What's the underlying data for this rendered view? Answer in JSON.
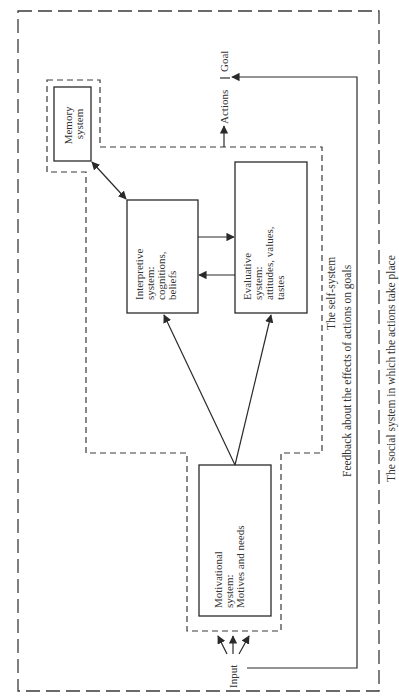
{
  "diagram": {
    "boxes": {
      "memory": {
        "lines": [
          "Memory",
          "system"
        ]
      },
      "interpretive": {
        "lines": [
          "Interpretive",
          "system:",
          "cognitions,",
          "beliefs"
        ]
      },
      "evaluative": {
        "lines": [
          "Evaluative",
          "system:",
          "attitudes, values,",
          "tastes"
        ]
      },
      "motivational": {
        "lines": [
          "Motivational",
          "system:",
          "Motives and needs"
        ]
      }
    },
    "labels": {
      "actions": "Actions",
      "goal": "Goal",
      "input": "Input",
      "self_system": "The self-system",
      "feedback": "Feedback about the effects of actions on goals",
      "social_system": "The social system in which the actions take place"
    },
    "colors": {
      "stroke": "#2a2a2a",
      "text": "#333333",
      "background": "#ffffff"
    }
  }
}
